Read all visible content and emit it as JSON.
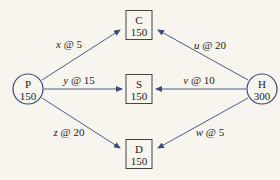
{
  "colors": {
    "background": "#f7f5ee",
    "edge": "#3d4a7a",
    "circle_stroke": "#3d4a7a",
    "box_stroke": "#444444",
    "text": "#222222"
  },
  "nodes": [
    {
      "id": "P",
      "label": "P",
      "value": "150",
      "shape": "circle",
      "cx": 28,
      "cy": 89,
      "r": 15
    },
    {
      "id": "C",
      "label": "C",
      "value": "150",
      "shape": "box",
      "cx": 139,
      "cy": 25,
      "w": 26,
      "h": 29
    },
    {
      "id": "S",
      "label": "S",
      "value": "150",
      "shape": "box",
      "cx": 139,
      "cy": 89,
      "w": 26,
      "h": 29
    },
    {
      "id": "D",
      "label": "D",
      "value": "150",
      "shape": "box",
      "cx": 139,
      "cy": 154,
      "w": 26,
      "h": 29
    },
    {
      "id": "H",
      "label": "H",
      "value": "300",
      "shape": "circle",
      "cx": 262,
      "cy": 89,
      "r": 15
    }
  ],
  "edges": [
    {
      "from": "P",
      "to": "C",
      "var": "x",
      "cost": "5",
      "x1": 42,
      "y1": 80,
      "x2": 120,
      "y2": 30,
      "lx": 69,
      "ly": 48
    },
    {
      "from": "P",
      "to": "S",
      "var": "y",
      "cost": "15",
      "x1": 44,
      "y1": 89,
      "x2": 122,
      "y2": 89,
      "lx": 79,
      "ly": 84
    },
    {
      "from": "P",
      "to": "D",
      "var": "z",
      "cost": "20",
      "x1": 42,
      "y1": 98,
      "x2": 120,
      "y2": 148,
      "lx": 69,
      "ly": 136
    },
    {
      "from": "H",
      "to": "C",
      "var": "u",
      "cost": "20",
      "x1": 248,
      "y1": 80,
      "x2": 158,
      "y2": 30,
      "lx": 210,
      "ly": 49
    },
    {
      "from": "H",
      "to": "S",
      "var": "v",
      "cost": "10",
      "x1": 246,
      "y1": 89,
      "x2": 156,
      "y2": 89,
      "lx": 199,
      "ly": 84
    },
    {
      "from": "H",
      "to": "D",
      "var": "w",
      "cost": "5",
      "x1": 248,
      "y1": 98,
      "x2": 158,
      "y2": 148,
      "lx": 210,
      "ly": 136
    }
  ]
}
